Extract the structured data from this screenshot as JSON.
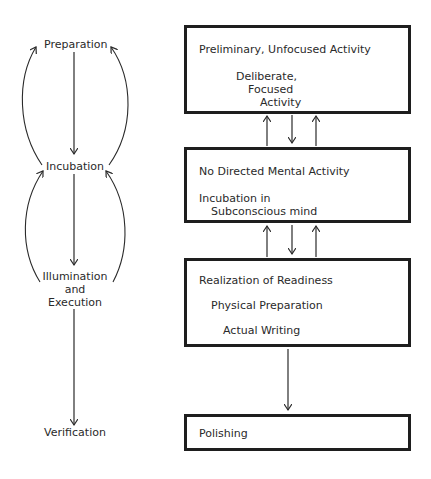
{
  "stages": {
    "preparation": "Preparation",
    "incubation": "Incubation",
    "illumination_line1": "Illumination",
    "illumination_line2": "and",
    "illumination_line3": "Execution",
    "verification": "Verification"
  },
  "boxes": {
    "box1": {
      "line1": "Preliminary, Unfocused Activity",
      "line2": "Deliberate,",
      "line3": "Focused",
      "line4": "Activity"
    },
    "box2": {
      "line1": "No Directed Mental Activity",
      "line2": "Incubation in",
      "line3": "Subconscious mind"
    },
    "box3": {
      "line1": "Realization of Readiness",
      "line2": "Physical Preparation",
      "line3": "Actual Writing"
    },
    "box4": {
      "line1": "Polishing"
    }
  },
  "colors": {
    "line": "#2a2a2a",
    "border": "#1e1e1e",
    "background": "#ffffff"
  }
}
